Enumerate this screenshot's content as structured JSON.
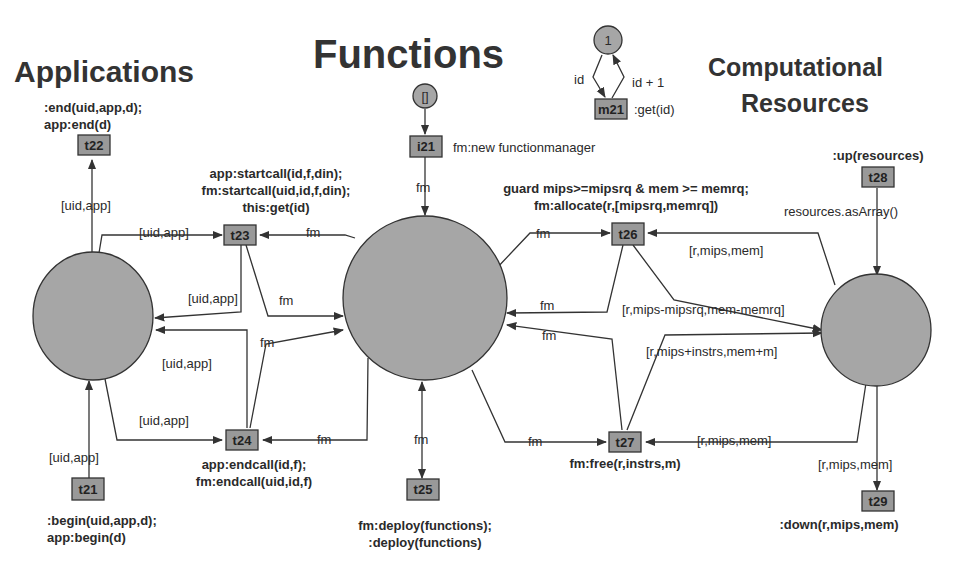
{
  "titles": {
    "applications": "Applications",
    "functions": "Functions",
    "computational_line1": "Computational",
    "computational_line2": "Resources"
  },
  "colors": {
    "place_fill": "#a6a6a6",
    "transition_fill": "#999999",
    "stroke": "#333333",
    "background": "#ffffff"
  },
  "places": {
    "applications": {
      "label": ""
    },
    "functions": {
      "label": ""
    },
    "resources": {
      "label": ""
    },
    "init_fm": {
      "label": "[]"
    },
    "counter": {
      "label": "1"
    }
  },
  "transitions": {
    "t21": {
      "id": "t21",
      "line1": ":begin(uid,app,d);",
      "line2": "app:begin(d)"
    },
    "t22": {
      "id": "t22",
      "line1": ":end(uid,app,d);",
      "line2": "app:end(d)"
    },
    "t23": {
      "id": "t23",
      "line1": "app:startcall(id,f,din);",
      "line2": "fm:startcall(uid,id,f,din);",
      "line3": "this:get(id)"
    },
    "t24": {
      "id": "t24",
      "line1": "app:endcall(id,f);",
      "line2": "fm:endcall(uid,id,f)"
    },
    "t25": {
      "id": "t25",
      "line1": "fm:deploy(functions);",
      "line2": ":deploy(functions)"
    },
    "t26": {
      "id": "t26",
      "line1": "guard mips>=mipsrq & mem >= memrq;",
      "line2": "fm:allocate(r,[mipsrq,memrq])"
    },
    "t27": {
      "id": "t27",
      "line1": "fm:free(r,instrs,m)"
    },
    "t28": {
      "id": "t28",
      "line1": ":up(resources)"
    },
    "t29": {
      "id": "t29",
      "line1": ":down(r,mips,mem)"
    },
    "i21": {
      "id": "i21",
      "line1": "fm:new functionmanager"
    },
    "m21": {
      "id": "m21",
      "line1": ":get(id)"
    }
  },
  "arc_labels": {
    "t22_in": "[uid,app]",
    "t23_in_app": "[uid,app]",
    "t23_in_fm": "fm",
    "t23_out_app": "[uid,app]",
    "t23_out_fm": "fm",
    "t24_out_app": "[uid,app]",
    "t24_out_fm": "fm",
    "t24_in_app": "[uid,app]",
    "t24_in_fm": "fm",
    "t21_out": "[uid,app]",
    "i21_out": "fm",
    "t25_arc": "fm",
    "t26_in_fm": "fm",
    "t26_in_res": "[r,mips,mem]",
    "t26_out_fm": "fm",
    "t26_out_res": "[r,mips-mipsrq,mem-memrq]",
    "t27_in_fm": "fm",
    "t27_in_res": "[r,mips,mem]",
    "t27_out_fm": "fm",
    "t27_out_res": "[r,mips+instrs,mem+m]",
    "t28_out": "resources.asArray()",
    "t29_in": "[r,mips,mem]",
    "m21_in": "id",
    "m21_out": "id + 1"
  }
}
